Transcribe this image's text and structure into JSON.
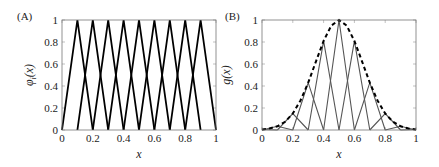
{
  "chart_data": [
    {
      "panel_label": "(A)",
      "type": "line",
      "title": "",
      "xlabel": "x",
      "ylabel": "φi(x)",
      "ylabel_main": "φ",
      "ylabel_sub": "i",
      "ylabel_tail": "(x)",
      "xlim": [
        0,
        1
      ],
      "ylim": [
        0,
        1
      ],
      "xticks": [
        "0",
        "0.2",
        "0.4",
        "0.6",
        "0.8",
        "1"
      ],
      "yticks": [
        "0",
        "0.2",
        "0.4",
        "0.6",
        "0.8",
        "1"
      ],
      "grid": false,
      "legend": null,
      "line_color": "#000000",
      "series": [
        {
          "name": "φ1",
          "x": [
            0.0,
            0.1,
            0.2
          ],
          "y": [
            0,
            1,
            0
          ]
        },
        {
          "name": "φ2",
          "x": [
            0.1,
            0.2,
            0.3
          ],
          "y": [
            0,
            1,
            0
          ]
        },
        {
          "name": "φ3",
          "x": [
            0.2,
            0.3,
            0.4
          ],
          "y": [
            0,
            1,
            0
          ]
        },
        {
          "name": "φ4",
          "x": [
            0.3,
            0.4,
            0.5
          ],
          "y": [
            0,
            1,
            0
          ]
        },
        {
          "name": "φ5",
          "x": [
            0.4,
            0.5,
            0.6
          ],
          "y": [
            0,
            1,
            0
          ]
        },
        {
          "name": "φ6",
          "x": [
            0.5,
            0.6,
            0.7
          ],
          "y": [
            0,
            1,
            0
          ]
        },
        {
          "name": "φ7",
          "x": [
            0.6,
            0.7,
            0.8
          ],
          "y": [
            0,
            1,
            0
          ]
        },
        {
          "name": "φ8",
          "x": [
            0.7,
            0.8,
            0.9
          ],
          "y": [
            0,
            1,
            0
          ]
        },
        {
          "name": "φ9",
          "x": [
            0.8,
            0.9,
            1.0
          ],
          "y": [
            0,
            1,
            0
          ]
        }
      ]
    },
    {
      "panel_label": "(B)",
      "type": "line",
      "title": "",
      "xlabel": "x",
      "ylabel": "g(x)",
      "xlim": [
        0,
        1
      ],
      "ylim": [
        0,
        1
      ],
      "xticks": [
        "0",
        "0.2",
        "0.4",
        "0.6",
        "0.8",
        "1"
      ],
      "yticks": [
        "0",
        "0.2",
        "0.4",
        "0.6",
        "0.8",
        "1"
      ],
      "grid": false,
      "legend": null,
      "line_color": "#555555",
      "dashed_color": "#000000",
      "series": [
        {
          "name": "g(x) (dashed)",
          "style": "dashed",
          "x": [
            0,
            0.05,
            0.1,
            0.15,
            0.2,
            0.25,
            0.3,
            0.35,
            0.4,
            0.45,
            0.5,
            0.55,
            0.6,
            0.65,
            0.7,
            0.75,
            0.8,
            0.85,
            0.9,
            0.95,
            1.0
          ],
          "y": [
            0.005,
            0.014,
            0.034,
            0.075,
            0.15,
            0.268,
            0.43,
            0.622,
            0.81,
            0.949,
            1.0,
            0.949,
            0.81,
            0.622,
            0.43,
            0.268,
            0.15,
            0.075,
            0.034,
            0.014,
            0.005
          ]
        },
        {
          "name": "g0·φ0",
          "x": [
            0.0,
            0.1
          ],
          "y": [
            0.005,
            0
          ]
        },
        {
          "name": "g1·φ1",
          "x": [
            0.0,
            0.1,
            0.2
          ],
          "y": [
            0,
            0.034,
            0
          ]
        },
        {
          "name": "g2·φ2",
          "x": [
            0.1,
            0.2,
            0.3
          ],
          "y": [
            0,
            0.15,
            0
          ]
        },
        {
          "name": "g3·φ3",
          "x": [
            0.2,
            0.3,
            0.4
          ],
          "y": [
            0,
            0.43,
            0
          ]
        },
        {
          "name": "g4·φ4",
          "x": [
            0.3,
            0.4,
            0.5
          ],
          "y": [
            0,
            0.81,
            0
          ]
        },
        {
          "name": "g5·φ5",
          "x": [
            0.4,
            0.5,
            0.6
          ],
          "y": [
            0,
            1.0,
            0
          ]
        },
        {
          "name": "g6·φ6",
          "x": [
            0.5,
            0.6,
            0.7
          ],
          "y": [
            0,
            0.81,
            0
          ]
        },
        {
          "name": "g7·φ7",
          "x": [
            0.6,
            0.7,
            0.8
          ],
          "y": [
            0,
            0.43,
            0
          ]
        },
        {
          "name": "g8·φ8",
          "x": [
            0.7,
            0.8,
            0.9
          ],
          "y": [
            0,
            0.15,
            0
          ]
        },
        {
          "name": "g9·φ9",
          "x": [
            0.8,
            0.9,
            1.0
          ],
          "y": [
            0,
            0.034,
            0
          ]
        },
        {
          "name": "g10·φ10",
          "x": [
            0.9,
            1.0
          ],
          "y": [
            0,
            0.005
          ]
        }
      ]
    }
  ]
}
